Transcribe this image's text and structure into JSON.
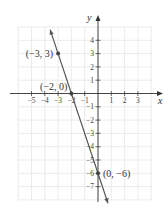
{
  "chart_data": {
    "type": "line",
    "title": "",
    "xlabel": "x",
    "ylabel": "y",
    "xlim": [
      -6,
      4
    ],
    "ylim": [
      -8,
      5
    ],
    "grid": true,
    "x_ticks": [
      -5,
      -4,
      -3,
      -2,
      -1,
      1,
      2,
      3
    ],
    "x_tick_labels": [
      "−5",
      "−4",
      "−3",
      "−2",
      "−1",
      "1",
      "2",
      "3"
    ],
    "y_ticks": [
      4,
      3,
      2,
      1,
      -1,
      -2,
      -3,
      -4,
      -5,
      -6,
      -7
    ],
    "y_tick_labels": [
      "4",
      "3",
      "2",
      "1",
      "−1",
      "−2",
      "−3",
      "−4",
      "−5",
      "−6",
      "−7"
    ],
    "series": [
      {
        "name": "line",
        "equation": "y = -3x - 6",
        "x": [
          -3.6,
          0.75
        ],
        "y": [
          4.8,
          -8.25
        ],
        "color": "#555555"
      }
    ],
    "points": [
      {
        "x": -3,
        "y": 3,
        "label": "(−3, 3)"
      },
      {
        "x": -2,
        "y": 0,
        "label": "(−2, 0)"
      },
      {
        "x": 0,
        "y": -6,
        "label": "(0, −6)"
      }
    ]
  },
  "colors": {
    "grid": "#dddddd",
    "axis": "#333333",
    "line": "#555555",
    "point": "#444444"
  }
}
